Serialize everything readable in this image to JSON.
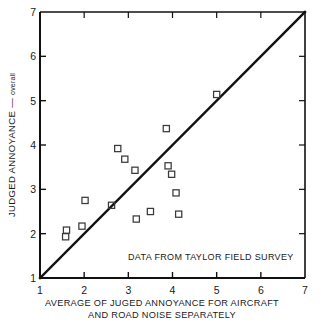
{
  "chart_data": {
    "type": "scatter",
    "title": "",
    "xlabel": "AVERAGE OF JUGED ANNOYANCE FOR AIRCRAFT AND ROAD NOISE SEPARATELY",
    "xlabel_line1": "AVERAGE OF JUGED ANNOYANCE FOR AIRCRAFT",
    "xlabel_line2": "AND ROAD NOISE SEPARATELY",
    "ylabel": "JUDGED ANNOYANCE — overall",
    "ylabel_main": "JUDGED ANNOYANCE",
    "ylabel_dash": "—",
    "ylabel_sub": "overall",
    "xlim": [
      1,
      7
    ],
    "ylim": [
      1,
      7
    ],
    "xticks": [
      1,
      2,
      3,
      4,
      5,
      6,
      7
    ],
    "yticks": [
      1,
      2,
      3,
      4,
      5,
      6,
      7
    ],
    "xtick_labels": [
      "1",
      "2",
      "3",
      "4",
      "5",
      "6",
      "7"
    ],
    "ytick_labels": [
      "1",
      "2",
      "3",
      "4",
      "5",
      "6",
      "7"
    ],
    "grid": false,
    "legend": null,
    "marker": "open-square",
    "marker_color": "#3a3a3a",
    "line_color": "#111111",
    "annotations": [
      {
        "text": "DATA FROM TAYLOR FIELD SURVEY",
        "x": 3.9,
        "y": 1.55
      }
    ],
    "reference_line": {
      "name": "identity-line",
      "from": [
        1,
        1
      ],
      "to": [
        7,
        7
      ],
      "label": "y = x"
    },
    "series": [
      {
        "name": "Taylor field survey responses",
        "points": [
          {
            "x": 1.58,
            "y": 1.93
          },
          {
            "x": 1.6,
            "y": 2.08
          },
          {
            "x": 1.95,
            "y": 2.17
          },
          {
            "x": 2.02,
            "y": 2.75
          },
          {
            "x": 2.62,
            "y": 2.64
          },
          {
            "x": 2.76,
            "y": 3.92
          },
          {
            "x": 2.92,
            "y": 3.68
          },
          {
            "x": 3.15,
            "y": 3.43
          },
          {
            "x": 3.18,
            "y": 2.33
          },
          {
            "x": 3.5,
            "y": 2.5
          },
          {
            "x": 3.86,
            "y": 4.37
          },
          {
            "x": 3.9,
            "y": 3.53
          },
          {
            "x": 3.98,
            "y": 3.34
          },
          {
            "x": 4.08,
            "y": 2.92
          },
          {
            "x": 4.14,
            "y": 2.44
          },
          {
            "x": 5.0,
            "y": 5.14
          }
        ]
      }
    ]
  }
}
